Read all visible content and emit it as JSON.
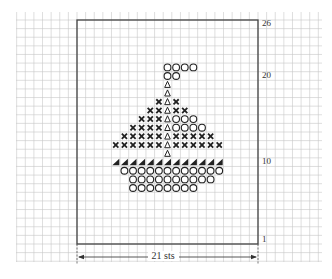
{
  "chart": {
    "stitches": 21,
    "rows": 26,
    "width_label": "21 sts",
    "row_labels": [
      {
        "row": 26,
        "text": "26"
      },
      {
        "row": 20,
        "text": "20"
      },
      {
        "row": 10,
        "text": "10"
      },
      {
        "row": 1,
        "text": "1"
      }
    ],
    "colors": {
      "grid": "#c8c8c8",
      "frame": "#444444",
      "symbol": "#222222",
      "bg": "#ffffff"
    }
  },
  "legend_symbols": {
    "O": "circle",
    "X": "cross",
    "T": "open-triangle",
    "S": "filled-corner-triangle"
  },
  "motif": [
    {
      "row": 21,
      "cells": [
        [
          11,
          "O"
        ],
        [
          12,
          "O"
        ],
        [
          13,
          "O"
        ],
        [
          14,
          "O"
        ]
      ]
    },
    {
      "row": 20,
      "cells": [
        [
          11,
          "O"
        ],
        [
          12,
          "O"
        ]
      ]
    },
    {
      "row": 19,
      "cells": [
        [
          11,
          "T"
        ]
      ]
    },
    {
      "row": 18,
      "cells": [
        [
          11,
          "T"
        ]
      ]
    },
    {
      "row": 17,
      "cells": [
        [
          10,
          "X"
        ],
        [
          11,
          "T"
        ],
        [
          12,
          "X"
        ]
      ]
    },
    {
      "row": 16,
      "cells": [
        [
          9,
          "X"
        ],
        [
          10,
          "X"
        ],
        [
          11,
          "T"
        ],
        [
          12,
          "X"
        ],
        [
          13,
          "X"
        ]
      ]
    },
    {
      "row": 15,
      "cells": [
        [
          8,
          "X"
        ],
        [
          9,
          "X"
        ],
        [
          10,
          "X"
        ],
        [
          11,
          "T"
        ],
        [
          12,
          "O"
        ],
        [
          13,
          "O"
        ],
        [
          14,
          "O"
        ]
      ]
    },
    {
      "row": 14,
      "cells": [
        [
          7,
          "X"
        ],
        [
          8,
          "X"
        ],
        [
          9,
          "X"
        ],
        [
          10,
          "X"
        ],
        [
          11,
          "T"
        ],
        [
          12,
          "O"
        ],
        [
          13,
          "O"
        ],
        [
          14,
          "O"
        ],
        [
          15,
          "O"
        ]
      ]
    },
    {
      "row": 13,
      "cells": [
        [
          6,
          "X"
        ],
        [
          7,
          "X"
        ],
        [
          8,
          "X"
        ],
        [
          9,
          "X"
        ],
        [
          10,
          "X"
        ],
        [
          11,
          "T"
        ],
        [
          12,
          "X"
        ],
        [
          13,
          "X"
        ],
        [
          14,
          "X"
        ],
        [
          15,
          "X"
        ],
        [
          16,
          "X"
        ]
      ]
    },
    {
      "row": 12,
      "cells": [
        [
          5,
          "X"
        ],
        [
          6,
          "X"
        ],
        [
          7,
          "X"
        ],
        [
          8,
          "X"
        ],
        [
          9,
          "X"
        ],
        [
          10,
          "X"
        ],
        [
          11,
          "T"
        ],
        [
          12,
          "X"
        ],
        [
          13,
          "X"
        ],
        [
          14,
          "X"
        ],
        [
          15,
          "X"
        ],
        [
          16,
          "X"
        ],
        [
          17,
          "X"
        ]
      ]
    },
    {
      "row": 11,
      "cells": [
        [
          11,
          "T"
        ]
      ]
    },
    {
      "row": 10,
      "cells": [
        [
          5,
          "S"
        ],
        [
          6,
          "S"
        ],
        [
          7,
          "S"
        ],
        [
          8,
          "S"
        ],
        [
          9,
          "S"
        ],
        [
          10,
          "S"
        ],
        [
          11,
          "S"
        ],
        [
          12,
          "S"
        ],
        [
          13,
          "S"
        ],
        [
          14,
          "S"
        ],
        [
          15,
          "S"
        ],
        [
          16,
          "S"
        ],
        [
          17,
          "S"
        ]
      ]
    },
    {
      "row": 9,
      "cells": [
        [
          6,
          "O"
        ],
        [
          7,
          "O"
        ],
        [
          8,
          "O"
        ],
        [
          9,
          "O"
        ],
        [
          10,
          "O"
        ],
        [
          11,
          "O"
        ],
        [
          12,
          "O"
        ],
        [
          13,
          "O"
        ],
        [
          14,
          "O"
        ],
        [
          15,
          "O"
        ],
        [
          16,
          "O"
        ],
        [
          17,
          "O"
        ]
      ]
    },
    {
      "row": 8,
      "cells": [
        [
          7,
          "O"
        ],
        [
          8,
          "O"
        ],
        [
          9,
          "O"
        ],
        [
          10,
          "O"
        ],
        [
          11,
          "O"
        ],
        [
          12,
          "O"
        ],
        [
          13,
          "O"
        ],
        [
          14,
          "O"
        ],
        [
          15,
          "O"
        ],
        [
          16,
          "O"
        ]
      ]
    },
    {
      "row": 7,
      "cells": [
        [
          7,
          "O"
        ],
        [
          8,
          "O"
        ],
        [
          9,
          "O"
        ],
        [
          10,
          "O"
        ],
        [
          11,
          "O"
        ],
        [
          12,
          "O"
        ],
        [
          13,
          "O"
        ],
        [
          14,
          "O"
        ]
      ]
    }
  ]
}
